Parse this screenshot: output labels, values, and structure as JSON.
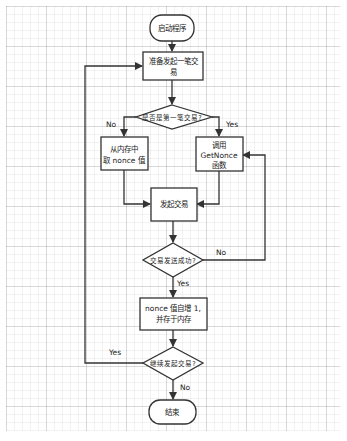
{
  "diagram": {
    "type": "flowchart",
    "colors": {
      "stroke": "#333333",
      "fill": "#ffffff",
      "text": "#222222",
      "grid": "#e6e6e6"
    },
    "nodes": {
      "start": {
        "shape": "terminal",
        "label": "启动程序"
      },
      "prepare": {
        "shape": "process",
        "line1": "准备发起一笔交",
        "line2": "易"
      },
      "is_first": {
        "shape": "decision",
        "label": "是否是第一笔交易?"
      },
      "from_memory": {
        "shape": "process",
        "line1": "从内存中",
        "line2": "取 nonce 值"
      },
      "call_getnonce": {
        "shape": "process",
        "line1": "调用",
        "line2": "GetNonce",
        "line3": "函数"
      },
      "send_tx": {
        "shape": "process",
        "label": "发起交易"
      },
      "tx_success": {
        "shape": "decision",
        "label": "交易发送成功?"
      },
      "increment": {
        "shape": "process",
        "line1": "nonce 值自增 1,",
        "line2": "并存于内存"
      },
      "continue": {
        "shape": "decision",
        "label": "继续发起交易?"
      },
      "end": {
        "shape": "terminal",
        "label": "结束"
      }
    },
    "edge_labels": {
      "first_no": "No",
      "first_yes": "Yes",
      "success_no": "No",
      "success_yes": "Yes",
      "continue_yes": "Yes",
      "continue_no": "No"
    }
  }
}
